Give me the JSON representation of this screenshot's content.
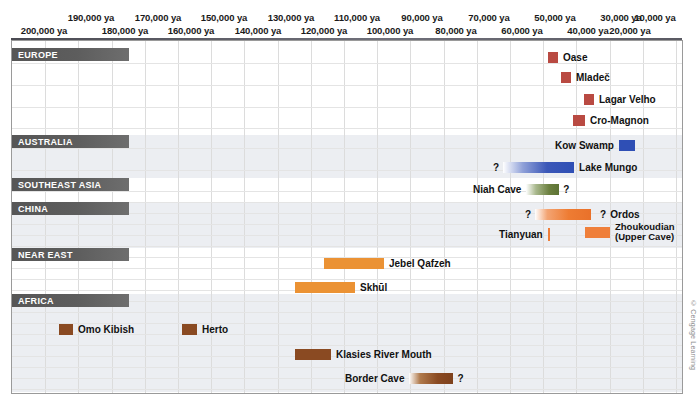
{
  "chart_data": {
    "type": "bar",
    "xlabel": "years ago",
    "xlim": [
      200000,
      0
    ],
    "grid": true,
    "axis_ticks_top": [
      "190,000 ya",
      "170,000 ya",
      "150,000 ya",
      "130,000 ya",
      "110,000 ya",
      "90,000 ya",
      "70,000 ya",
      "50,000 ya",
      "30,000 ya",
      "10,000 ya"
    ],
    "axis_ticks_bottom": [
      "200,000 ya",
      "180,000 ya",
      "160,000 ya",
      "140,000 ya",
      "120,000 ya",
      "100,000 ya",
      "80,000 ya",
      "60,000 ya",
      "40,000 ya",
      "20,000 ya"
    ],
    "regions": [
      {
        "name": "EUROPE",
        "color": "#b94a42",
        "items": [
          {
            "label": "Oase",
            "start": 36000,
            "end": 34000,
            "uncertain_left": false,
            "uncertain_right": false,
            "label_side": "right"
          },
          {
            "label": "Mladeč",
            "start": 32000,
            "end": 30500,
            "uncertain_left": false,
            "uncertain_right": false,
            "label_side": "right"
          },
          {
            "label": "Lagar Velho",
            "start": 25500,
            "end": 24500,
            "uncertain_left": false,
            "uncertain_right": false,
            "label_side": "right"
          },
          {
            "label": "Cro-Magnon",
            "start": 28500,
            "end": 26500,
            "uncertain_left": false,
            "uncertain_right": false,
            "label_side": "right"
          }
        ]
      },
      {
        "name": "AUSTRALIA",
        "color": "#2f4fb5",
        "items": [
          {
            "label": "Kow Swamp",
            "start": 13500,
            "end": 11000,
            "uncertain_left": false,
            "uncertain_right": false,
            "label_side": "left"
          },
          {
            "label": "Lake Mungo",
            "start": 62000,
            "end": 40000,
            "uncertain_left": true,
            "uncertain_right": false,
            "label_side": "right",
            "gradient": true
          }
        ]
      },
      {
        "name": "SOUTHEAST ASIA",
        "color": "#6c8040",
        "items": [
          {
            "label": "Niah Cave",
            "start": 45000,
            "end": 39000,
            "uncertain_left": false,
            "uncertain_right": true,
            "label_side": "left",
            "gradient": true
          }
        ]
      },
      {
        "name": "CHINA",
        "color": "#ef7f3a",
        "items": [
          {
            "label": "Ordos",
            "start": 38000,
            "end": 28000,
            "uncertain_left": true,
            "uncertain_right": true,
            "label_side": "right",
            "gradient": true
          },
          {
            "label": "Tianyuan",
            "start": 40000,
            "end": 40000,
            "uncertain_left": false,
            "uncertain_right": false,
            "label_side": "left",
            "tick": true
          },
          {
            "label": "Zhoukoudian\n(Upper Cave)",
            "start": 29500,
            "end": 26000,
            "uncertain_left": false,
            "uncertain_right": false,
            "label_side": "right",
            "two_line": true
          }
        ]
      },
      {
        "name": "NEAR EAST",
        "color": "#eb9234",
        "items": [
          {
            "label": "Jebel Qafzeh",
            "start": 110000,
            "end": 92000,
            "uncertain_left": false,
            "uncertain_right": false,
            "label_side": "right"
          },
          {
            "label": "Skhūl",
            "start": 119000,
            "end": 101000,
            "uncertain_left": false,
            "uncertain_right": false,
            "label_side": "right"
          }
        ]
      },
      {
        "name": "AFRICA",
        "color": "#8a4a22",
        "items": [
          {
            "label": "Omo Kibish",
            "start": 196000,
            "end": 192000,
            "uncertain_left": false,
            "uncertain_right": false,
            "label_side": "right"
          },
          {
            "label": "Herto",
            "start": 156000,
            "end": 152000,
            "uncertain_left": false,
            "uncertain_right": false,
            "label_side": "right"
          },
          {
            "label": "Klasies River Mouth",
            "start": 121000,
            "end": 110000,
            "uncertain_left": false,
            "uncertain_right": false,
            "label_side": "right"
          },
          {
            "label": "Border Cave",
            "start": 91000,
            "end": 78000,
            "uncertain_left": false,
            "uncertain_right": true,
            "label_side": "left",
            "gradient": true
          }
        ]
      }
    ]
  },
  "axis": {
    "top_row": [
      {
        "text": "190,000 ya",
        "x": 91
      },
      {
        "text": "170,000 ya",
        "x": 158
      },
      {
        "text": "150,000 ya",
        "x": 224
      },
      {
        "text": "130,000 ya",
        "x": 291
      },
      {
        "text": "110,000 ya",
        "x": 357
      },
      {
        "text": "90,000 ya",
        "x": 422
      },
      {
        "text": "70,000 ya",
        "x": 489
      },
      {
        "text": "50,000 ya",
        "x": 555
      },
      {
        "text": "30,000 ya",
        "x": 621
      },
      {
        "text": "10,000 ya",
        "x": 655
      }
    ],
    "bottom_row": [
      {
        "text": "200,000 ya",
        "x": 44
      },
      {
        "text": "180,000 ya",
        "x": 125
      },
      {
        "text": "160,000 ya",
        "x": 191
      },
      {
        "text": "140,000 ya",
        "x": 258
      },
      {
        "text": "120,000 ya",
        "x": 324
      },
      {
        "text": "100,000 ya",
        "x": 390
      },
      {
        "text": "80,000 ya",
        "x": 456
      },
      {
        "text": "60,000 ya",
        "x": 522
      },
      {
        "text": "40,000 ya",
        "x": 588
      },
      {
        "text": "20,000 ya",
        "x": 630
      }
    ]
  },
  "regions": [
    {
      "name": "EUROPE",
      "top": 48,
      "width": 117,
      "band": false,
      "height": 87
    },
    {
      "name": "AUSTRALIA",
      "top": 135,
      "width": 117,
      "band": true,
      "height": 43
    },
    {
      "name": "SOUTHEAST ASIA",
      "top": 178,
      "width": 117,
      "band": false,
      "height": 24
    },
    {
      "name": "CHINA",
      "top": 202,
      "width": 117,
      "band": true,
      "height": 46
    },
    {
      "name": "NEAR EAST",
      "top": 248,
      "width": 117,
      "band": false,
      "height": 46
    },
    {
      "name": "AFRICA",
      "top": 294,
      "width": 117,
      "band": true,
      "height": 98
    }
  ],
  "items": [
    {
      "name": "oase",
      "label": "Oase",
      "barx": 536,
      "barw": 10,
      "y": 51,
      "side": "right",
      "cls": "c-eu",
      "ql": "",
      "qr": ""
    },
    {
      "name": "mladec",
      "label": "Mladeč",
      "barx": 549,
      "barw": 10,
      "y": 71,
      "side": "right",
      "cls": "c-eu",
      "ql": "",
      "qr": ""
    },
    {
      "name": "lagar-velho",
      "label": "Lagar Velho",
      "barx": 572,
      "barw": 10,
      "y": 93,
      "side": "right",
      "cls": "c-eu",
      "ql": "",
      "qr": ""
    },
    {
      "name": "cro-magnon",
      "label": "Cro-Magnon",
      "barx": 561,
      "barw": 12,
      "y": 114,
      "side": "right",
      "cls": "c-eu",
      "ql": "",
      "qr": ""
    },
    {
      "name": "kow-swamp",
      "label": "Kow Swamp",
      "barx": 612,
      "barw": 16,
      "y": 139,
      "side": "left",
      "cls": "c-au",
      "ql": "",
      "qr": ""
    },
    {
      "name": "lake-mungo",
      "label": "Lake Mungo",
      "barx": 493,
      "barw": 71,
      "y": 161,
      "side": "right",
      "cls": "c-au-g",
      "ql": "?",
      "qr": ""
    },
    {
      "name": "niah-cave",
      "label": "Niah Cave",
      "barx": 519,
      "barw": 33,
      "y": 183,
      "side": "left",
      "cls": "c-sea-g",
      "ql": "",
      "qr": "?"
    },
    {
      "name": "ordos",
      "label": "Ordos",
      "barx": 525,
      "barw": 56,
      "y": 208,
      "side": "right",
      "cls": "c-cn-g",
      "ql": "?",
      "qr": "?"
    },
    {
      "name": "tianyuan",
      "label": "Tianyuan",
      "barx": 544,
      "barw": 2,
      "y": 228,
      "side": "left",
      "cls": "c-tian",
      "ql": "",
      "qr": ""
    },
    {
      "name": "zhoukoudian",
      "label": "Zhoukoudian",
      "label2": "(Upper Cave)",
      "barx": 573,
      "barw": 25,
      "y": 226,
      "side": "right",
      "cls": "c-cn",
      "ql": "",
      "qr": ""
    },
    {
      "name": "jebel-qafzeh",
      "label": "Jebel Qafzeh",
      "barx": 312,
      "barw": 60,
      "y": 257,
      "side": "right",
      "cls": "c-ne",
      "ql": "",
      "qr": ""
    },
    {
      "name": "skhul",
      "label": "Skhūl",
      "barx": 283,
      "barw": 60,
      "y": 281,
      "side": "right",
      "cls": "c-ne",
      "ql": "",
      "qr": ""
    },
    {
      "name": "omo-kibish",
      "label": "Omo Kibish",
      "barx": 47,
      "barw": 14,
      "y": 323,
      "side": "right",
      "cls": "c-af",
      "ql": "",
      "qr": ""
    },
    {
      "name": "herto",
      "label": "Herto",
      "barx": 170,
      "barw": 15,
      "y": 323,
      "side": "right",
      "cls": "c-af",
      "ql": "",
      "qr": ""
    },
    {
      "name": "klasies",
      "label": "Klasies River Mouth",
      "barx": 283,
      "barw": 36,
      "y": 348,
      "side": "right",
      "cls": "c-af",
      "ql": "",
      "qr": ""
    },
    {
      "name": "border-cave",
      "label": "Border Cave",
      "barx": 400,
      "barw": 44,
      "y": 372,
      "side": "left",
      "cls": "c-af-g",
      "ql": "",
      "qr": "?"
    }
  ],
  "credit": {
    "text": "© Cengage Learning"
  }
}
